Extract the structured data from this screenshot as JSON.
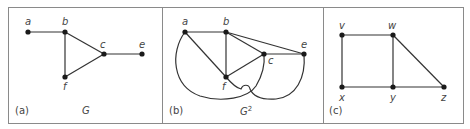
{
  "colors": {
    "border": "#8a8a8a",
    "edge": "#333333",
    "node": "#1a1a1a",
    "text": "#444444"
  },
  "panels": [
    {
      "id": "a",
      "panel_label": "(a)",
      "graph_name": "G",
      "graph_sup": "",
      "nodes": [
        {
          "name": "a",
          "x": 28,
          "y": 32
        },
        {
          "name": "b",
          "x": 65,
          "y": 32
        },
        {
          "name": "c",
          "x": 104,
          "y": 54
        },
        {
          "name": "e",
          "x": 142,
          "y": 54
        },
        {
          "name": "f",
          "x": 65,
          "y": 77
        }
      ],
      "edges": [
        [
          "a",
          "b"
        ],
        [
          "b",
          "c"
        ],
        [
          "b",
          "f"
        ],
        [
          "f",
          "c"
        ],
        [
          "c",
          "e"
        ]
      ]
    },
    {
      "id": "b",
      "panel_label": "(b)",
      "graph_name": "G",
      "graph_sup": "2",
      "nodes": [
        {
          "name": "a",
          "x": 185,
          "y": 32
        },
        {
          "name": "b",
          "x": 226,
          "y": 32
        },
        {
          "name": "c",
          "x": 264,
          "y": 54
        },
        {
          "name": "e",
          "x": 304,
          "y": 54
        },
        {
          "name": "f",
          "x": 226,
          "y": 77
        }
      ],
      "edges": [
        [
          "a",
          "b"
        ],
        [
          "a",
          "f"
        ],
        [
          "b",
          "f"
        ],
        [
          "b",
          "c"
        ],
        [
          "b",
          "e"
        ],
        [
          "c",
          "e"
        ],
        [
          "f",
          "c"
        ],
        [
          "a",
          "c"
        ],
        [
          "f",
          "e"
        ]
      ]
    },
    {
      "id": "c",
      "panel_label": "(c)",
      "graph_name": "",
      "graph_sup": "",
      "nodes": [
        {
          "name": "v",
          "x": 342,
          "y": 35
        },
        {
          "name": "w",
          "x": 393,
          "y": 35
        },
        {
          "name": "x",
          "x": 342,
          "y": 87
        },
        {
          "name": "y",
          "x": 393,
          "y": 87
        },
        {
          "name": "z",
          "x": 444,
          "y": 87
        }
      ],
      "edges": [
        [
          "v",
          "w"
        ],
        [
          "v",
          "x"
        ],
        [
          "w",
          "y"
        ],
        [
          "w",
          "z"
        ],
        [
          "x",
          "y"
        ],
        [
          "y",
          "z"
        ]
      ]
    }
  ]
}
